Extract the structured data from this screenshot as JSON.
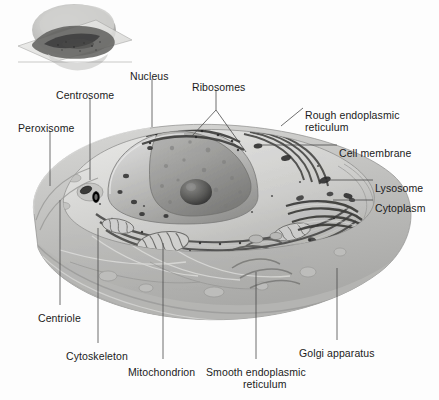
{
  "figure": {
    "background_color": "#fdfdfd",
    "text_color": "#1b1b1b",
    "leader_color": "#4a4a4a",
    "inset": {
      "name": "whole-cell-inset",
      "description": "Small whole cell with sectioning plane, upper left"
    }
  },
  "labels": [
    {
      "id": "peroxisome",
      "text": "Peroxisome",
      "x": 18,
      "y": 123,
      "align": "left"
    },
    {
      "id": "centrosome",
      "text": "Centrosome",
      "x": 56,
      "y": 90,
      "align": "left"
    },
    {
      "id": "nucleus",
      "text": "Nucleus",
      "x": 130,
      "y": 71,
      "align": "left"
    },
    {
      "id": "ribosomes",
      "text": "Ribosomes",
      "x": 192,
      "y": 82,
      "align": "left"
    },
    {
      "id": "rough-er",
      "text": "Rough endoplasmic",
      "x": 305,
      "y": 110,
      "align": "left"
    },
    {
      "id": "rough-er-2",
      "text": "reticulum",
      "x": 305,
      "y": 122,
      "align": "left"
    },
    {
      "id": "cell-membrane",
      "text": "Cell membrane",
      "x": 339,
      "y": 148,
      "align": "left"
    },
    {
      "id": "lysosome",
      "text": "Lysosome",
      "x": 375,
      "y": 183,
      "align": "left"
    },
    {
      "id": "cytoplasm",
      "text": "Cytoplasm",
      "x": 375,
      "y": 203,
      "align": "left"
    },
    {
      "id": "golgi",
      "text": "Golgi apparatus",
      "x": 299,
      "y": 348,
      "align": "left"
    },
    {
      "id": "smooth-er",
      "text": "Smooth endoplasmic",
      "x": 206,
      "y": 367,
      "align": "left"
    },
    {
      "id": "smooth-er-2",
      "text": "reticulum",
      "x": 243,
      "y": 379,
      "align": "left"
    },
    {
      "id": "mitochondrion",
      "text": "Mitochondrion",
      "x": 128,
      "y": 367,
      "align": "left"
    },
    {
      "id": "cytoskeleton",
      "text": "Cytoskeleton",
      "x": 66,
      "y": 351,
      "align": "left"
    },
    {
      "id": "centriole",
      "text": "Centriole",
      "x": 38,
      "y": 313,
      "align": "left"
    }
  ],
  "leaders": [
    {
      "id": "leader-peroxisome",
      "points": "50,131 50,186"
    },
    {
      "id": "leader-centrosome",
      "points": "90,98 90,180"
    },
    {
      "id": "leader-nucleus",
      "points": "152,79 152,127"
    },
    {
      "id": "leader-ribosomes-a",
      "points": "216,90 216,110 192,136"
    },
    {
      "id": "leader-ribosomes-b",
      "points": "216,110 246,152"
    },
    {
      "id": "leader-rough-er",
      "points": "303,108 281,126"
    },
    {
      "id": "leader-cell-membrane",
      "points": "337,145 259,145"
    },
    {
      "id": "leader-lysosome",
      "points": "373,180 325,180"
    },
    {
      "id": "leader-cytoplasm",
      "points": "373,200 333,200"
    },
    {
      "id": "leader-golgi",
      "points": "337,340 337,268"
    },
    {
      "id": "leader-smooth-er",
      "points": "256,359 256,272"
    },
    {
      "id": "leader-mitochondrion",
      "points": "163,359 163,243"
    },
    {
      "id": "leader-cytoskeleton",
      "points": "98,343 98,228"
    },
    {
      "id": "leader-centriole",
      "points": "60,305 60,200"
    }
  ]
}
